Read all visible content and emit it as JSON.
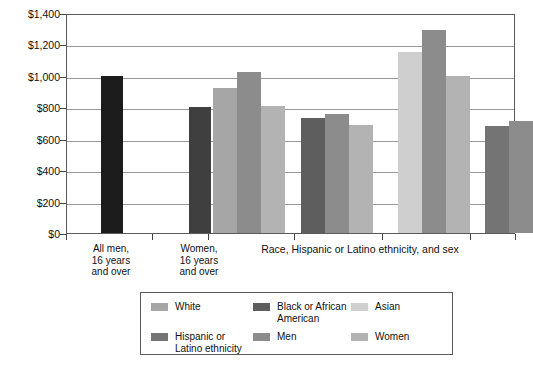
{
  "chart_data": {
    "type": "bar",
    "title": "",
    "xlabel": "Race, Hispanic or Latino ethnicity, and sex",
    "ylabel": "",
    "ylim": [
      0,
      1400
    ],
    "ytick_step": 200,
    "grid": true,
    "legend_position": "bottom",
    "ytick_labels": [
      "$1,400",
      "$1,200",
      "$1,000",
      "$800",
      "$600",
      "$400",
      "$200",
      "$0"
    ],
    "ytick_values": [
      1400,
      1200,
      1000,
      800,
      600,
      400,
      200,
      0
    ],
    "standalone_bars": [
      {
        "label": "All men,\n16 years\nand over",
        "value": 1000,
        "color": "#1c1c1c"
      },
      {
        "label": "Women,\n16 years\nand over",
        "value": 800,
        "color": "#3f3f3f"
      }
    ],
    "categories": [
      "White",
      "Black or African American",
      "Asian",
      "Hispanic or Latino ethnicity"
    ],
    "series": [
      {
        "name": "race",
        "values": [
          925,
          730,
          1150,
          680
        ]
      },
      {
        "name": "Men",
        "values": [
          1025,
          760,
          1290,
          710
        ]
      },
      {
        "name": "Women",
        "values": [
          810,
          690,
          1000,
          615
        ]
      }
    ],
    "groups": [
      {
        "category": "White",
        "bars": [
          {
            "series": "White",
            "value": 925,
            "color": "#a6a6a6"
          },
          {
            "series": "Men",
            "value": 1025,
            "color": "#8c8c8c"
          },
          {
            "series": "Women",
            "value": 810,
            "color": "#b3b3b3"
          }
        ]
      },
      {
        "category": "Black or African American",
        "bars": [
          {
            "series": "Black or African American",
            "value": 730,
            "color": "#5e5e5e"
          },
          {
            "series": "Men",
            "value": 760,
            "color": "#8c8c8c"
          },
          {
            "series": "Women",
            "value": 690,
            "color": "#b3b3b3"
          }
        ]
      },
      {
        "category": "Asian",
        "bars": [
          {
            "series": "Asian",
            "value": 1150,
            "color": "#cfcfcf"
          },
          {
            "series": "Men",
            "value": 1290,
            "color": "#8c8c8c"
          },
          {
            "series": "Women",
            "value": 1000,
            "color": "#b3b3b3"
          }
        ]
      },
      {
        "category": "Hispanic or Latino ethnicity",
        "bars": [
          {
            "series": "Hispanic or Latino ethnicity",
            "value": 680,
            "color": "#747474"
          },
          {
            "series": "Men",
            "value": 710,
            "color": "#8c8c8c"
          },
          {
            "series": "Women",
            "value": 615,
            "color": "#b3b3b3"
          }
        ]
      }
    ],
    "legend": [
      {
        "label": "White",
        "color": "#a6a6a6"
      },
      {
        "label": "Black or African\nAmerican",
        "color": "#5e5e5e"
      },
      {
        "label": "Asian",
        "color": "#cfcfcf"
      },
      {
        "label": "Hispanic or\nLatino ethnicity",
        "color": "#747474"
      },
      {
        "label": "Men",
        "color": "#8c8c8c"
      },
      {
        "label": "Women",
        "color": "#b3b3b3"
      }
    ]
  },
  "colors": {
    "axis": "#5a5a5a",
    "grid": "#9a9a9a",
    "text": "#111111",
    "background": "#ffffff"
  }
}
